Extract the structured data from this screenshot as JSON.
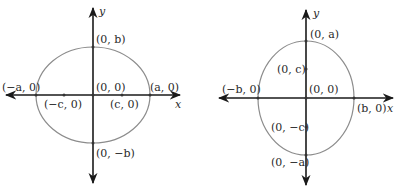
{
  "diagrams": [
    {
      "name": "horizontal-ellipse",
      "axis_labels": {
        "x": "x",
        "y": "y"
      },
      "labels": {
        "top_vertex": "(0, b)",
        "bottom_vertex": "(0, −b)",
        "left_vertex": "(−a, 0)",
        "right_vertex": "(a, 0)",
        "center": "(0, 0)",
        "left_focus": "(−c, 0)",
        "right_focus": "(c, 0)"
      }
    },
    {
      "name": "vertical-ellipse",
      "axis_labels": {
        "x": "x",
        "y": "y"
      },
      "labels": {
        "top_vertex": "(0, a)",
        "bottom_vertex": "(0, −a)",
        "left_vertex": "(−b, 0)",
        "right_vertex": "(b, 0)",
        "center": "(0, 0)",
        "top_focus": "(0, c)",
        "bottom_focus": "(0, −c)"
      }
    }
  ],
  "colors": {
    "axis": "#1a1a1a",
    "ellipse": "#8c8c8c",
    "text": "#2a2a2a"
  }
}
